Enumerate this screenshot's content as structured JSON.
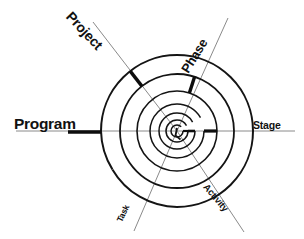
{
  "diagram": {
    "type": "spiral-hierarchy",
    "background_color": "#ffffff",
    "line_color": "#1a1a1a",
    "axis_color": "#777777",
    "center": {
      "x": 177,
      "y": 131
    },
    "outer_radius": 76,
    "spiral_turns": 4,
    "levels": [
      {
        "name": "program",
        "label": "Program",
        "angle_deg": 180,
        "order": 1,
        "emphasis": "primary"
      },
      {
        "name": "project",
        "label": "Project",
        "angle_deg": 128,
        "order": 2,
        "emphasis": "primary"
      },
      {
        "name": "phase",
        "label": "Phase",
        "angle_deg": 72,
        "order": 3,
        "emphasis": "primary"
      },
      {
        "name": "stage",
        "label": "Stage",
        "angle_deg": 0,
        "order": 4,
        "emphasis": "secondary"
      },
      {
        "name": "activity",
        "label": "Activity",
        "angle_deg": 308,
        "order": 5,
        "emphasis": "tertiary"
      },
      {
        "name": "task",
        "label": "Task",
        "angle_deg": 251,
        "order": 6,
        "emphasis": "tertiary"
      }
    ],
    "labels": {
      "program": "Program",
      "project": "Project",
      "phase": "Phase",
      "stage": "Stage",
      "task": "Task",
      "activity": "Activity"
    }
  }
}
